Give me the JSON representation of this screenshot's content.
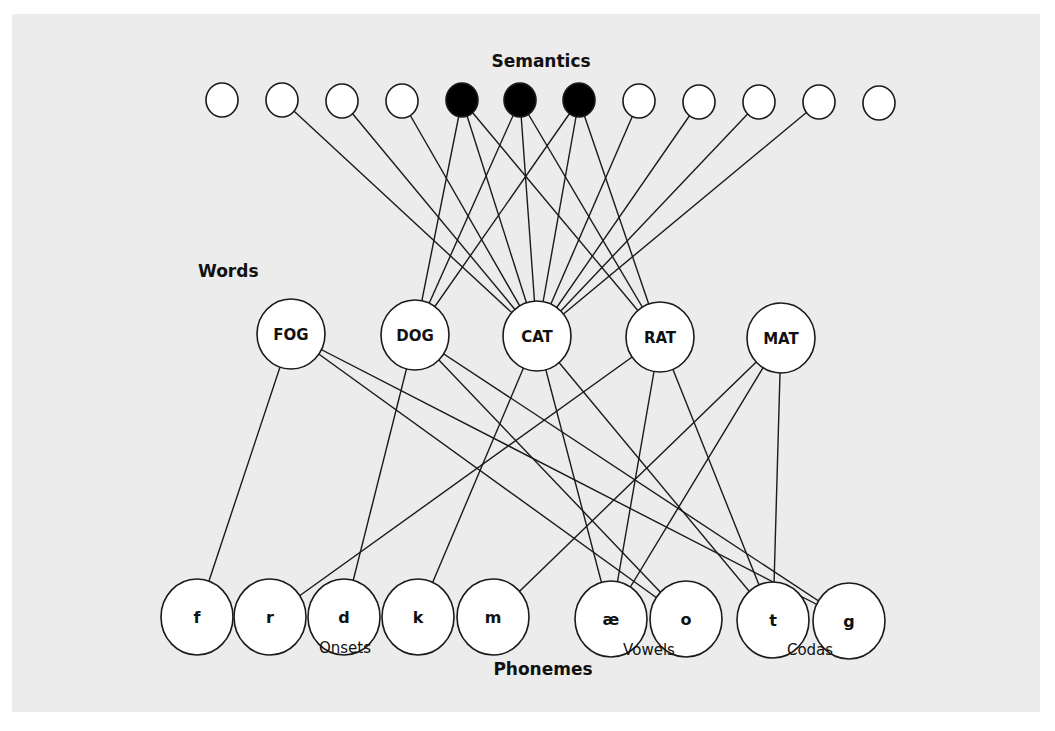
{
  "diagram": {
    "layers": {
      "semantics": "Semantics",
      "words": "Words",
      "phonemes": "Phonemes"
    },
    "phoneme_groups": {
      "onsets": "Onsets",
      "vowels": "Vowels",
      "codas": "Codas"
    },
    "colors": {
      "page_background": "#ececec",
      "node_fill": "#ffffff",
      "active_node_fill": "#000000",
      "stroke": "#1a1a1a"
    },
    "semantic_nodes": [
      {
        "id": "s1",
        "x": 222,
        "y": 100,
        "active": false
      },
      {
        "id": "s2",
        "x": 282,
        "y": 100,
        "active": false
      },
      {
        "id": "s3",
        "x": 342,
        "y": 101,
        "active": false
      },
      {
        "id": "s4",
        "x": 402,
        "y": 101,
        "active": false
      },
      {
        "id": "s5",
        "x": 462,
        "y": 100,
        "active": true
      },
      {
        "id": "s6",
        "x": 520,
        "y": 100,
        "active": true
      },
      {
        "id": "s7",
        "x": 579,
        "y": 100,
        "active": true
      },
      {
        "id": "s8",
        "x": 639,
        "y": 101,
        "active": false
      },
      {
        "id": "s9",
        "x": 699,
        "y": 102,
        "active": false
      },
      {
        "id": "s10",
        "x": 759,
        "y": 102,
        "active": false
      },
      {
        "id": "s11",
        "x": 819,
        "y": 102,
        "active": false
      },
      {
        "id": "s12",
        "x": 879,
        "y": 103,
        "active": false
      }
    ],
    "word_nodes": [
      {
        "id": "FOG",
        "label": "FOG",
        "x": 291,
        "y": 334
      },
      {
        "id": "DOG",
        "label": "DOG",
        "x": 415,
        "y": 335
      },
      {
        "id": "CAT",
        "label": "CAT",
        "x": 537,
        "y": 336
      },
      {
        "id": "RAT",
        "label": "RAT",
        "x": 660,
        "y": 337
      },
      {
        "id": "MAT",
        "label": "MAT",
        "x": 781,
        "y": 338
      }
    ],
    "phoneme_nodes": [
      {
        "id": "f",
        "label": "f",
        "x": 197,
        "y": 617,
        "group": "onsets"
      },
      {
        "id": "r",
        "label": "r",
        "x": 270,
        "y": 617,
        "group": "onsets"
      },
      {
        "id": "d",
        "label": "d",
        "x": 344,
        "y": 617,
        "group": "onsets"
      },
      {
        "id": "k",
        "label": "k",
        "x": 418,
        "y": 617,
        "group": "onsets"
      },
      {
        "id": "m",
        "label": "m",
        "x": 493,
        "y": 617,
        "group": "onsets"
      },
      {
        "id": "ae",
        "label": "æ",
        "x": 611,
        "y": 619,
        "group": "vowels"
      },
      {
        "id": "o",
        "label": "o",
        "x": 686,
        "y": 619,
        "group": "vowels"
      },
      {
        "id": "t",
        "label": "t",
        "x": 773,
        "y": 620,
        "group": "codas"
      },
      {
        "id": "g",
        "label": "g",
        "x": 849,
        "y": 621,
        "group": "codas"
      }
    ],
    "semantic_word_edges": [
      [
        "s2",
        "CAT"
      ],
      [
        "s3",
        "CAT"
      ],
      [
        "s4",
        "CAT"
      ],
      [
        "s5",
        "DOG"
      ],
      [
        "s5",
        "CAT"
      ],
      [
        "s5",
        "RAT"
      ],
      [
        "s6",
        "DOG"
      ],
      [
        "s6",
        "CAT"
      ],
      [
        "s6",
        "RAT"
      ],
      [
        "s7",
        "DOG"
      ],
      [
        "s7",
        "CAT"
      ],
      [
        "s7",
        "RAT"
      ],
      [
        "s8",
        "CAT"
      ],
      [
        "s9",
        "CAT"
      ],
      [
        "s10",
        "CAT"
      ],
      [
        "s11",
        "CAT"
      ]
    ],
    "word_phoneme_edges": [
      [
        "FOG",
        "f"
      ],
      [
        "FOG",
        "o"
      ],
      [
        "FOG",
        "g"
      ],
      [
        "DOG",
        "d"
      ],
      [
        "DOG",
        "o"
      ],
      [
        "DOG",
        "g"
      ],
      [
        "CAT",
        "k"
      ],
      [
        "CAT",
        "ae"
      ],
      [
        "CAT",
        "t"
      ],
      [
        "RAT",
        "r"
      ],
      [
        "RAT",
        "ae"
      ],
      [
        "RAT",
        "t"
      ],
      [
        "MAT",
        "m"
      ],
      [
        "MAT",
        "ae"
      ],
      [
        "MAT",
        "t"
      ]
    ]
  }
}
